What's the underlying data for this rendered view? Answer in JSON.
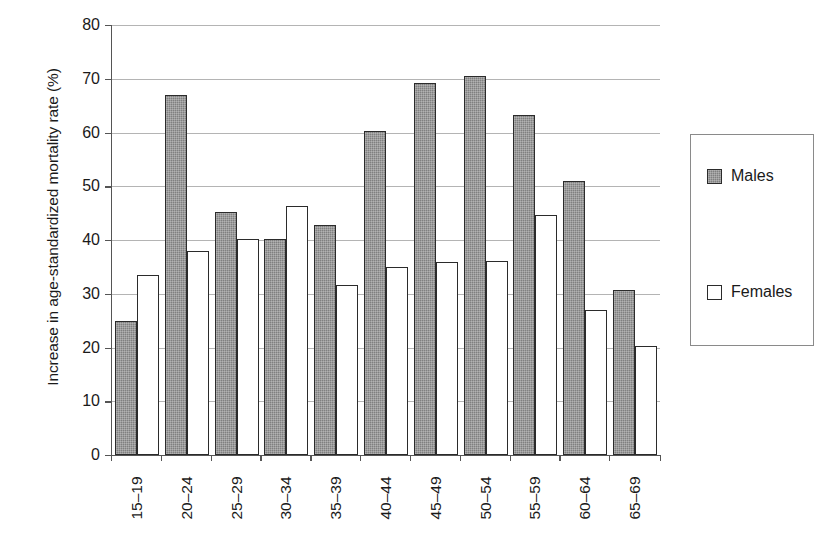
{
  "chart_data": {
    "type": "bar",
    "title": "",
    "xlabel": "",
    "ylabel": "Increase in age-standardized mortality rate (%)",
    "ylim": [
      0,
      80
    ],
    "ytick_step": 10,
    "yticks": [
      "0",
      "10",
      "20",
      "30",
      "40",
      "50",
      "60",
      "70",
      "80"
    ],
    "grid": true,
    "legend_position": "right",
    "categories": [
      "15–19",
      "20–24",
      "25–29",
      "30–34",
      "35–39",
      "40–44",
      "45–49",
      "50–54",
      "55–59",
      "60–64",
      "65–69"
    ],
    "series": [
      {
        "name": "Males",
        "color": "#808080",
        "values": [
          25.0,
          67.0,
          45.3,
          40.1,
          42.8,
          60.2,
          69.2,
          70.6,
          63.2,
          51.0,
          30.7
        ]
      },
      {
        "name": "Females",
        "color": "#ffffff",
        "values": [
          33.5,
          38.0,
          40.1,
          46.4,
          31.7,
          34.9,
          36.0,
          36.1,
          44.6,
          27.0,
          20.3
        ]
      }
    ]
  },
  "legend": {
    "entries": [
      {
        "label": "Males",
        "swatch": "filled-gray-swatch"
      },
      {
        "label": "Females",
        "swatch": "empty-white-swatch"
      }
    ]
  }
}
